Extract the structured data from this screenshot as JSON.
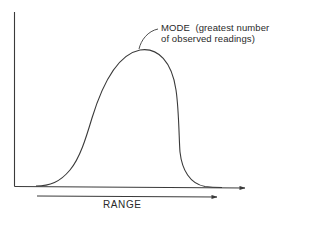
{
  "diagram": {
    "type": "frequency-distribution-curve",
    "annotations": {
      "mode_line1": "MODE  (greatest number",
      "mode_line2": "of observed readings)",
      "range": "RANGE"
    },
    "colors": {
      "stroke": "#3a3a3a",
      "text": "#2a2a2a",
      "background": "#ffffff"
    }
  }
}
